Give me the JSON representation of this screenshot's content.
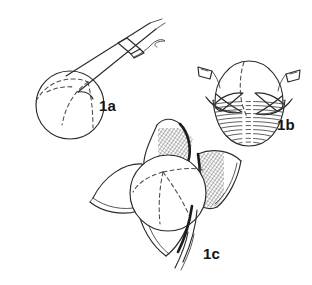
{
  "figure": {
    "caption_present": false,
    "background_color": "#ffffff",
    "ink_color": "#2b2b2b",
    "shading_color": "#3a3a3a",
    "panels": [
      {
        "id": "panel-1a",
        "label": "1a",
        "label_x": 99,
        "label_y": 98,
        "description": "spherical bud on an angled stalk with a sheath node and a thin wavy tendril",
        "parts": [
          "sphere",
          "dashed-meridian",
          "stalk",
          "sheath-node",
          "tendril"
        ]
      },
      {
        "id": "panel-1b",
        "label": "1b",
        "label_x": 277,
        "label_y": 117,
        "description": "cap-like upper half over a hatched lower hemisphere with two lateral hooked wings",
        "parts": [
          "upper-cap",
          "dashed-meridian",
          "hatched-hemisphere",
          "left-wing",
          "right-wing"
        ]
      },
      {
        "id": "panel-1c",
        "label": "1c",
        "label_x": 203,
        "label_y": 246,
        "description": "central sphere surrounded by four pointed sepals, two cross-hatched, with a stalk exiting lower right",
        "parts": [
          "central-sphere",
          "dashed-triradiate-meridian",
          "top-sepal",
          "left-sepal",
          "right-sepal",
          "bottom-sepal",
          "stalk"
        ]
      }
    ]
  }
}
